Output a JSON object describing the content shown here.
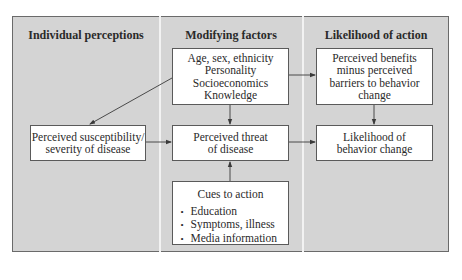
{
  "columns": [
    {
      "title": "Individual perceptions"
    },
    {
      "title": "Modifying factors"
    },
    {
      "title": "Likelihood of action"
    }
  ],
  "boxes": {
    "susceptibility": {
      "lines": [
        "Perceived susceptibility/",
        "severity of disease"
      ]
    },
    "modifying_factors": {
      "lines": [
        "Age, sex, ethnicity",
        "Personality",
        "Socioeconomics",
        "Knowledge"
      ]
    },
    "threat": {
      "lines": [
        "Perceived threat",
        "of disease"
      ]
    },
    "cues": {
      "title": "Cues to action",
      "items": [
        "Education",
        "Symptoms, illness",
        "Media information"
      ]
    },
    "benefits": {
      "lines": [
        "Perceived benefits",
        "minus perceived",
        "barriers to behavior",
        "change"
      ]
    },
    "likelihood": {
      "lines": [
        "Likelihood of",
        "behavior change"
      ]
    }
  },
  "arrows": [
    {
      "from": "modifying_factors",
      "to": "susceptibility"
    },
    {
      "from": "modifying_factors",
      "to": "threat"
    },
    {
      "from": "modifying_factors",
      "to": "benefits"
    },
    {
      "from": "susceptibility",
      "to": "threat"
    },
    {
      "from": "cues",
      "to": "threat"
    },
    {
      "from": "threat",
      "to": "likelihood"
    },
    {
      "from": "benefits",
      "to": "likelihood"
    }
  ],
  "colors": {
    "panel": "#d4d4d4",
    "box": "#ffffff",
    "border": "#5a5a5a",
    "arrow": "#3a3a3a"
  }
}
